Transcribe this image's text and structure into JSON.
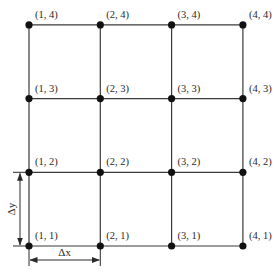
{
  "diagram": {
    "type": "grid-mesh",
    "columns": 4,
    "rows": 4,
    "origin_px": {
      "x": 29,
      "y": 246
    },
    "spacing_px": {
      "dx": 71.3,
      "dy": 73.7
    },
    "line_color": "#3a3a3a",
    "node_color": "#111111",
    "nodes": [
      {
        "i": 1,
        "j": 4,
        "label": "(1, 4)"
      },
      {
        "i": 2,
        "j": 4,
        "label": "(2, 4)"
      },
      {
        "i": 3,
        "j": 4,
        "label": "(3, 4)"
      },
      {
        "i": 4,
        "j": 4,
        "label": "(4, 4)"
      },
      {
        "i": 1,
        "j": 3,
        "label": "(1, 3)"
      },
      {
        "i": 2,
        "j": 3,
        "label": "(2, 3)"
      },
      {
        "i": 3,
        "j": 3,
        "label": "(3, 3)"
      },
      {
        "i": 4,
        "j": 3,
        "label": "(4, 3)"
      },
      {
        "i": 1,
        "j": 2,
        "label": "(1, 2)"
      },
      {
        "i": 2,
        "j": 2,
        "label": "(2, 2)"
      },
      {
        "i": 3,
        "j": 2,
        "label": "(3, 2)"
      },
      {
        "i": 4,
        "j": 2,
        "label": "(4, 2)"
      },
      {
        "i": 1,
        "j": 1,
        "label": "(1, 1)"
      },
      {
        "i": 2,
        "j": 1,
        "label": "(2, 1)"
      },
      {
        "i": 3,
        "j": 1,
        "label": "(3, 1)"
      },
      {
        "i": 4,
        "j": 1,
        "label": "(4, 1)"
      }
    ],
    "dimensions": {
      "dx": {
        "label": "Δx",
        "from_col": 1,
        "to_col": 2
      },
      "dy": {
        "label": "Δy",
        "from_row": 1,
        "to_row": 2
      }
    }
  }
}
